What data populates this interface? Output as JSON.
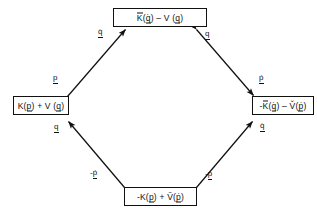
{
  "diagram": {
    "type": "commutative-diamond",
    "orientation": "diamond",
    "background_color": "#ffffff",
    "line_color": "#111111",
    "text_color": "#111111",
    "nodes": [
      {
        "id": "top",
        "position": "top",
        "text": "K̄(q̇) - V (q)",
        "plain": "Kbar(qdot) - V(q)"
      },
      {
        "id": "left",
        "position": "left",
        "text": "K(p) + V (q)",
        "plain": "K(p) + V(q)"
      },
      {
        "id": "right",
        "position": "right",
        "text": "-K̄(q̇) - V̌(ṗ)",
        "plain": "-Kbar(qdot) - Vcheck(pdot)"
      },
      {
        "id": "bottom",
        "position": "bottom",
        "text": "-K(p) + Ṽ(ṗ)",
        "plain": "-K(p) + Vtilde(pdot)"
      }
    ],
    "edges": [
      {
        "id": "left-top",
        "from": "left",
        "to": "top",
        "double_headed": true,
        "label_near_from": "p",
        "label_near_to": "q̇"
      },
      {
        "id": "top-right",
        "from": "top",
        "to": "right",
        "double_headed": true,
        "label_near_from": "q",
        "label_near_to": "ṗ"
      },
      {
        "id": "bottom-left",
        "from": "bottom",
        "to": "left",
        "double_headed": true,
        "label_near_from": "-ṗ",
        "label_near_to": "q"
      },
      {
        "id": "bottom-right",
        "from": "bottom",
        "to": "right",
        "double_headed": true,
        "label_near_from": "-p",
        "label_near_to": "q̇"
      }
    ],
    "labels": {
      "upper_left_outer": "p",
      "upper_left_inner": "q̇",
      "upper_right_inner": "q",
      "upper_right_outer": "ṗ",
      "lower_left_inner": "q",
      "lower_left_outer": "-ṗ",
      "lower_right_outer": "-p",
      "lower_right_inner": "q̇"
    }
  }
}
